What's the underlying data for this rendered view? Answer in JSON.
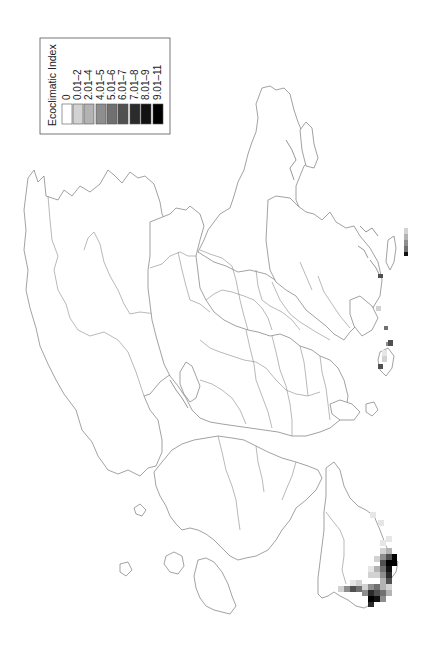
{
  "legend": {
    "title": "Ecoclimatic Index",
    "entries": [
      {
        "label": "0",
        "color": "#ffffff"
      },
      {
        "label": "0.01–2",
        "color": "#d2d2d2"
      },
      {
        "label": "2.01–4",
        "color": "#b3b3b3"
      },
      {
        "label": "4.01–5",
        "color": "#8e8e8e"
      },
      {
        "label": "5.01–6",
        "color": "#707070"
      },
      {
        "label": "6.01–7",
        "color": "#505050"
      },
      {
        "label": "7.01–8",
        "color": "#2b2b2b"
      },
      {
        "label": "8.01–9",
        "color": "#121212"
      },
      {
        "label": "9.01–11",
        "color": "#000000"
      }
    ]
  },
  "map": {
    "orientation": "rotated 90° (north to the right)",
    "region": "Northern and Central Europe",
    "outline_color": "#7a7a7a",
    "background": "#ffffff",
    "hotspots": [
      {
        "area": "bottom-right peninsula coast",
        "max_class": "9.01–11"
      },
      {
        "area": "bottom-right peninsula south tip",
        "max_class": "9.01–11"
      },
      {
        "area": "right edge island strip",
        "max_class": "8.01–9"
      },
      {
        "area": "right-middle small patch",
        "max_class": "6.01–7"
      },
      {
        "area": "right coastal island",
        "max_class": "6.01–7"
      }
    ]
  }
}
